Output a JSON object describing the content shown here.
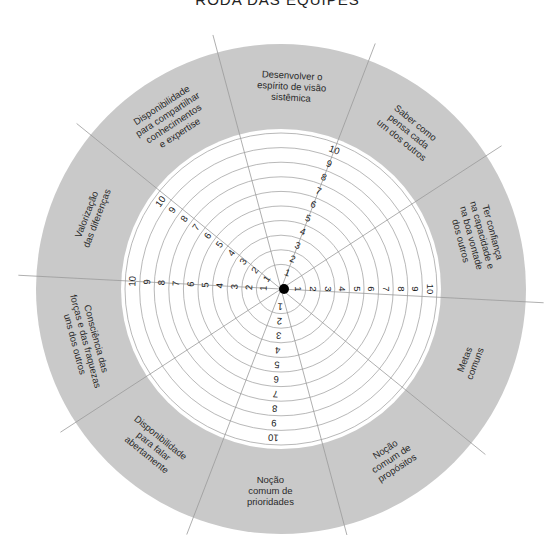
{
  "title": "RODA DAS EQUIPES",
  "colors": {
    "ring": "#c9c9c9",
    "inner": "#ffffff",
    "lines": "#9a9a9a",
    "text": "#2a2a2a",
    "center_dot": "#000000"
  },
  "scale": {
    "min": 1,
    "max": 10,
    "labels": [
      "1",
      "2",
      "3",
      "4",
      "5",
      "6",
      "7",
      "8",
      "9",
      "10"
    ]
  },
  "segments": [
    {
      "label_lines": [
        "Desenvolver o",
        "espírito de visão",
        "sistêmica"
      ]
    },
    {
      "label_lines": [
        "Saber como",
        "pensa cada",
        "um dos outros"
      ]
    },
    {
      "label_lines": [
        "Ter confiança",
        "na capacidade e",
        "na boa vontade",
        "dos outros"
      ]
    },
    {
      "label_lines": [
        "Metas",
        "comuns"
      ]
    },
    {
      "label_lines": [
        "Noção",
        "comum de",
        "propósitos"
      ]
    },
    {
      "label_lines": [
        "Noção",
        "comum de",
        "prioridades"
      ]
    },
    {
      "label_lines": [
        "Disponibilidade",
        "para falar",
        "abertamente"
      ]
    },
    {
      "label_lines": [
        "Consciência das",
        "forças e das fraquezas",
        "uns dos outros"
      ]
    },
    {
      "label_lines": [
        "Valorização",
        "das diferenças"
      ]
    },
    {
      "label_lines": [
        "Disponibilidade",
        "para compartilhar",
        "conhecimentos",
        "e expertise"
      ]
    }
  ]
}
